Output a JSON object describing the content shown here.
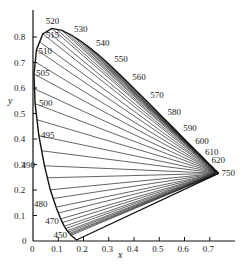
{
  "axes": {
    "x_label": "x",
    "y_label": "y",
    "x_ticks": [
      "0",
      "0.1",
      "0.2",
      "0.3",
      "0.4",
      "0.5",
      "0.6",
      "0.7"
    ],
    "y_ticks": [
      "0",
      "0.1",
      "0.2",
      "0.3",
      "0.4",
      "0.5",
      "0.6",
      "0.7",
      "0.8"
    ]
  },
  "locus_labels": [
    {
      "nm": "450",
      "x": 0.1566,
      "y": 0.0177
    },
    {
      "nm": "470",
      "x": 0.1241,
      "y": 0.0578
    },
    {
      "nm": "480",
      "x": 0.0913,
      "y": 0.1327
    },
    {
      "nm": "490",
      "x": 0.0454,
      "y": 0.295
    },
    {
      "nm": "495",
      "x": 0.0235,
      "y": 0.4127
    },
    {
      "nm": "500",
      "x": 0.0082,
      "y": 0.5384
    },
    {
      "nm": "505",
      "x": 0.0039,
      "y": 0.6548
    },
    {
      "nm": "510",
      "x": 0.0139,
      "y": 0.7502
    },
    {
      "nm": "515",
      "x": 0.0389,
      "y": 0.812
    },
    {
      "nm": "520",
      "x": 0.0743,
      "y": 0.8338
    },
    {
      "nm": "530",
      "x": 0.1547,
      "y": 0.8059
    },
    {
      "nm": "540",
      "x": 0.2296,
      "y": 0.7543
    },
    {
      "nm": "550",
      "x": 0.3016,
      "y": 0.6923
    },
    {
      "nm": "560",
      "x": 0.3731,
      "y": 0.6245
    },
    {
      "nm": "570",
      "x": 0.4441,
      "y": 0.5547
    },
    {
      "nm": "580",
      "x": 0.5125,
      "y": 0.4866
    },
    {
      "nm": "590",
      "x": 0.5752,
      "y": 0.4242
    },
    {
      "nm": "600",
      "x": 0.627,
      "y": 0.3725
    },
    {
      "nm": "610",
      "x": 0.6658,
      "y": 0.334
    },
    {
      "nm": "620",
      "x": 0.6915,
      "y": 0.3083
    },
    {
      "nm": "750",
      "x": 0.7347,
      "y": 0.2653
    }
  ]
}
